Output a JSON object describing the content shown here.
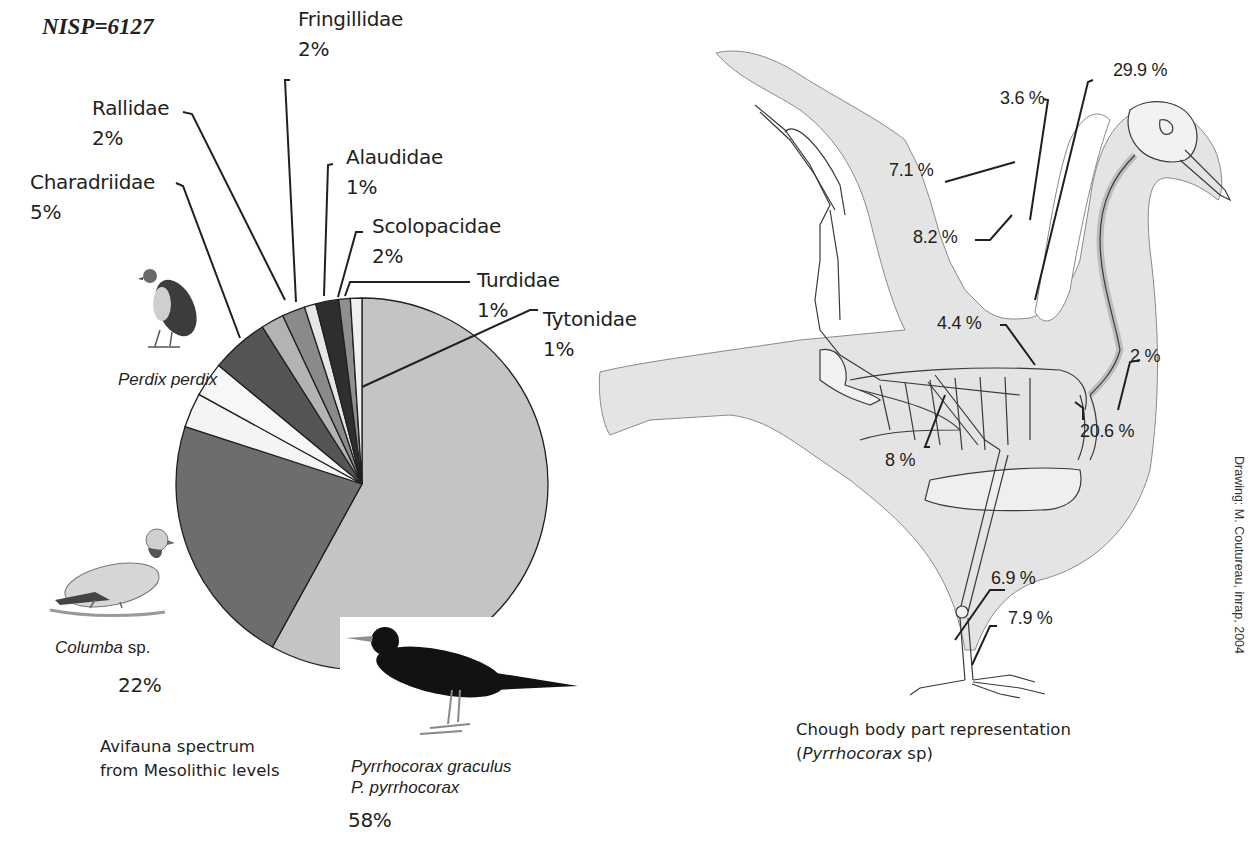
{
  "header": {
    "nisp": "NISP=6127"
  },
  "pie_labels": [
    {
      "name": "Rallidae",
      "pct": "2%"
    },
    {
      "name": "Fringillidae",
      "pct": "2%"
    },
    {
      "name": "Charadriidae",
      "pct": "5%"
    },
    {
      "name": "Alaudidae",
      "pct": "1%"
    },
    {
      "name": "Scolopacidae",
      "pct": "2%"
    },
    {
      "name": "Turdidae",
      "pct": "1%"
    },
    {
      "name": "Tytonidae",
      "pct": "1%"
    }
  ],
  "species_labels": {
    "perdix": {
      "genus": "Perdix perdix"
    },
    "columba": {
      "genus": "Columba",
      "suffix": " sp.",
      "pct": "22%"
    },
    "pyrrhocorax": {
      "line1": "Pyrrhocorax graculus",
      "line2": "P. pyrrhocorax",
      "pct": "58%"
    }
  },
  "captions": {
    "left_line1": "Avifauna spectrum",
    "left_line2": "from Mesolithic levels",
    "right_line1": "Chough body part representation",
    "right_line2_open": "(",
    "right_line2_italic": "Pyrrhocorax",
    "right_line2_rest": " sp)"
  },
  "credit": "Drawing: M. Coutureau, inrap, 2004",
  "body_parts": [
    {
      "id": "p3_6",
      "label": "3.6 %"
    },
    {
      "id": "p29_9",
      "label": "29.9 %"
    },
    {
      "id": "p7_1",
      "label": "7.1 %"
    },
    {
      "id": "p8_2",
      "label": "8.2 %"
    },
    {
      "id": "p4_4",
      "label": "4.4 %"
    },
    {
      "id": "p2",
      "label": "2 %"
    },
    {
      "id": "p20_6",
      "label": "20.6 %"
    },
    {
      "id": "p8",
      "label": "8 %"
    },
    {
      "id": "p6_9",
      "label": "6.9 %"
    },
    {
      "id": "p7_9",
      "label": "7.9 %"
    }
  ],
  "chart_data": [
    {
      "type": "pie",
      "title": "Avifauna spectrum from Mesolithic levels",
      "subtitle": "NISP=6127",
      "categories": [
        "Pyrrhocorax graculus / P. pyrrhocorax",
        "Columba sp.",
        "Perdix perdix (a)",
        "Perdix perdix (b)",
        "Charadriidae",
        "Rallidae",
        "Fringillidae",
        "Alaudidae",
        "Scolopacidae",
        "Turdidae",
        "Tytonidae"
      ],
      "values": [
        58,
        22,
        3,
        3,
        5,
        2,
        2,
        1,
        2,
        1,
        1
      ],
      "colors": [
        "#c4c4c4",
        "#6d6d6d",
        "#f4f4f4",
        "#f7f7f7",
        "#555555",
        "#b3b3b3",
        "#8a8a8a",
        "#e6e6e6",
        "#2e2e2e",
        "#8f8f8f",
        "#efefef"
      ],
      "start_angle_deg": 0,
      "direction": "clockwise"
    },
    {
      "type": "table",
      "title": "Chough body part representation (Pyrrhocorax sp)",
      "categories": [
        "wing distal (3.6%)",
        "humerus/coracoid (29.9%)",
        "carpometacarpus (7.1%)",
        "ulna/radius (8.2%)",
        "scapula (4.4%)",
        "furcula (2%)",
        "sternum (20.6%)",
        "pelvis (8%)",
        "tibiotarsus (6.9%)",
        "tarsometatarsus (7.9%)"
      ],
      "values": [
        3.6,
        29.9,
        7.1,
        8.2,
        4.4,
        2,
        20.6,
        8,
        6.9,
        7.9
      ]
    }
  ]
}
